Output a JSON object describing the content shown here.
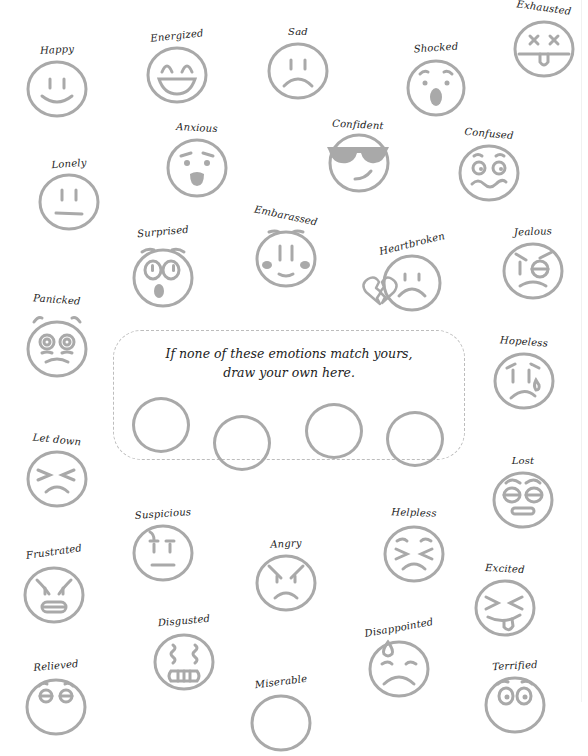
{
  "page": {
    "stroke_color": "#a9a9a9",
    "fill_color": "#a9a9a9",
    "label_color": "#222222"
  },
  "emotions": [
    {
      "label": "Happy",
      "icon": "smiling-face-icon"
    },
    {
      "label": "Energized",
      "icon": "grinning-face-icon"
    },
    {
      "label": "Sad",
      "icon": "frowning-face-icon"
    },
    {
      "label": "Shocked",
      "icon": "open-mouth-face-icon"
    },
    {
      "label": "Exhausted",
      "icon": "x-eyes-tongue-face-icon"
    },
    {
      "label": "Lonely",
      "icon": "neutral-face-icon"
    },
    {
      "label": "Anxious",
      "icon": "anxious-face-icon"
    },
    {
      "label": "Confident",
      "icon": "sunglasses-face-icon"
    },
    {
      "label": "Confused",
      "icon": "confused-face-icon"
    },
    {
      "label": "Surprised",
      "icon": "surprised-face-icon"
    },
    {
      "label": "Embarassed",
      "icon": "blushing-face-icon"
    },
    {
      "label": "Heartbroken",
      "icon": "broken-heart-face-icon"
    },
    {
      "label": "Jealous",
      "icon": "jealous-face-icon"
    },
    {
      "label": "Panicked",
      "icon": "panicked-face-icon"
    },
    {
      "label": "Hopeless",
      "icon": "crying-face-icon"
    },
    {
      "label": "Let down",
      "icon": "squinting-frown-face-icon"
    },
    {
      "label": "Lost",
      "icon": "rolling-eyes-face-icon"
    },
    {
      "label": "Suspicious",
      "icon": "suspicious-face-icon"
    },
    {
      "label": "Helpless",
      "icon": "persevering-face-icon"
    },
    {
      "label": "Frustrated",
      "icon": "grimacing-face-icon"
    },
    {
      "label": "Angry",
      "icon": "angry-face-icon"
    },
    {
      "label": "Excited",
      "icon": "squinting-tongue-face-icon"
    },
    {
      "label": "Disgusted",
      "icon": "nauseated-face-icon"
    },
    {
      "label": "Disappointed",
      "icon": "sweat-frown-face-icon"
    },
    {
      "label": "Relieved",
      "icon": "relieved-face-icon"
    },
    {
      "label": "Miserable",
      "icon": "miserable-face-icon"
    },
    {
      "label": "Terrified",
      "icon": "terrified-face-icon"
    }
  ],
  "draw_your_own": {
    "line1": "If none of these emotions match yours,",
    "line2": "draw your own here.",
    "blank_circles": 4
  }
}
